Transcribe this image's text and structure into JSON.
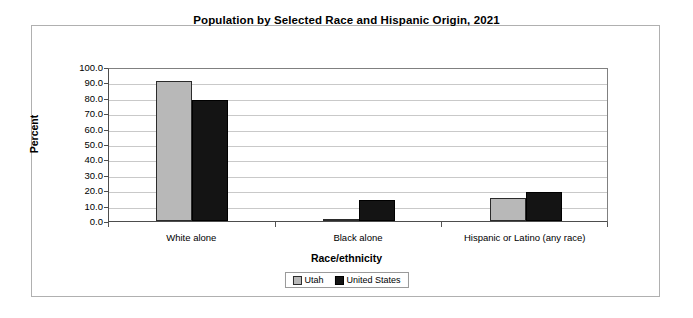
{
  "chart_data": {
    "type": "bar",
    "title": "Population by Selected Race and Hispanic Origin, 2021",
    "xlabel": "Race/ethnicity",
    "ylabel": "Percent",
    "categories": [
      "White alone",
      "Black alone",
      "Hispanic or Latino (any race)"
    ],
    "series": [
      {
        "name": "Utah",
        "color": "#b8b8b8",
        "values": [
          90.6,
          1.5,
          15.1
        ]
      },
      {
        "name": "United States",
        "color": "#141414",
        "values": [
          78.5,
          13.6,
          19.1
        ]
      }
    ],
    "ylim": [
      0,
      100
    ],
    "ytick_labels": [
      "100.0",
      "90.0",
      "80.0",
      "70.0",
      "60.0",
      "50.0",
      "40.0",
      "30.0",
      "20.0",
      "10.0",
      "0.0"
    ],
    "ytick_values": [
      100,
      90,
      80,
      70,
      60,
      50,
      40,
      30,
      20,
      10,
      0
    ],
    "grid": true,
    "legend_position": "bottom"
  }
}
